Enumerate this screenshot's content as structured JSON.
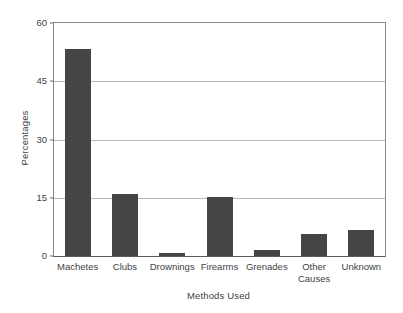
{
  "chart_data": {
    "type": "bar",
    "title": "",
    "xlabel": "Methods Used",
    "ylabel": "Percentages",
    "categories": [
      "Machetes",
      "Clubs",
      "Drownings",
      "Firearms",
      "Grenades",
      "Other Causes",
      "Unknown"
    ],
    "category_lines": [
      [
        "Machetes"
      ],
      [
        "Clubs"
      ],
      [
        "Drownings"
      ],
      [
        "Firearms"
      ],
      [
        "Grenades"
      ],
      [
        "Other",
        "Causes"
      ],
      [
        "Unknown"
      ]
    ],
    "values": [
      53.2,
      16.0,
      0.8,
      15.1,
      1.5,
      5.7,
      6.6
    ],
    "ylim": [
      0,
      60
    ],
    "yticks": [
      0,
      15,
      30,
      45,
      60
    ],
    "ytick_labels": [
      "0",
      "15",
      "30",
      "45",
      "60"
    ],
    "grid": "horizontal",
    "legend": "none",
    "bar_color": "#454545",
    "grid_color": "#b9b9b9",
    "axis_color": "#8a8a8a",
    "background_color": "#ffffff"
  }
}
